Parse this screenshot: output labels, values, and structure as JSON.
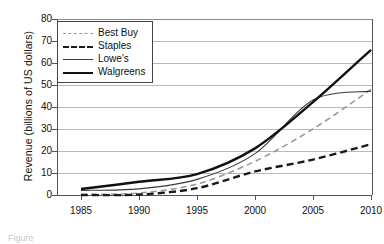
{
  "chart_data": {
    "type": "line",
    "title": "",
    "xlabel": "",
    "ylabel": "Revenue (billions of US dollars)",
    "x": [
      1985,
      1990,
      1995,
      2000,
      2005,
      2010
    ],
    "xticks": [
      "1985",
      "1990",
      "1995",
      "2000",
      "2005",
      "2010"
    ],
    "yticks": [
      "0",
      "10",
      "20",
      "30",
      "40",
      "50",
      "60",
      "70",
      "80"
    ],
    "xlim": [
      1983,
      2012
    ],
    "ylim": [
      0,
      80
    ],
    "grid": "horizontal",
    "legend_position": "top-left-inside",
    "series": [
      {
        "name": "Best Buy",
        "style": "dashed",
        "color": "#9a9a9a",
        "width": 1.6,
        "values": [
          0.2,
          0.9,
          5.0,
          15.3,
          30.0,
          48.0
        ]
      },
      {
        "name": "Staples",
        "style": "dashed",
        "color": "#1a1a1a",
        "width": 2.4,
        "values": [
          0.0,
          0.2,
          3.1,
          10.7,
          16.1,
          23.1
        ]
      },
      {
        "name": "Lowe's",
        "style": "solid",
        "color": "#3a3a3a",
        "width": 1.1,
        "values": [
          2.1,
          2.8,
          7.1,
          18.8,
          43.2,
          47.2
        ]
      },
      {
        "name": "Walgreens",
        "style": "solid",
        "color": "#111111",
        "width": 2.4,
        "values": [
          2.7,
          6.0,
          9.5,
          21.2,
          42.2,
          66.0
        ]
      }
    ]
  },
  "axes": {
    "ylabel": "Revenue (billions of US dollars)",
    "ytick_labels": [
      "80",
      "70",
      "60",
      "50",
      "40",
      "30",
      "20",
      "10",
      "0"
    ],
    "xtick_labels": [
      "1985",
      "1990",
      "1995",
      "2000",
      "2005",
      "2010"
    ]
  },
  "legend": {
    "items": [
      {
        "label": "Best Buy"
      },
      {
        "label": "Staples"
      },
      {
        "label": "Lowe's"
      },
      {
        "label": "Walgreens"
      }
    ]
  },
  "caption": {
    "text": "Figure"
  }
}
